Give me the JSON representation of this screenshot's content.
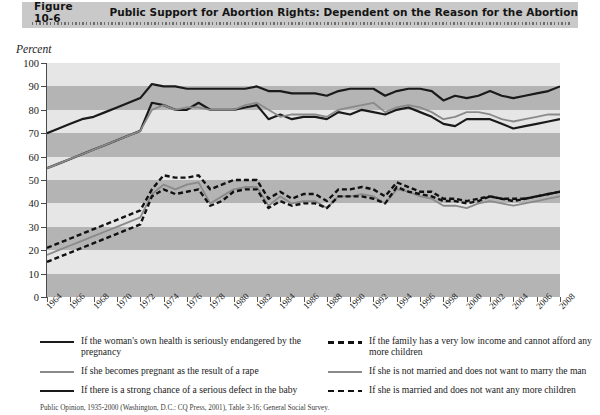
{
  "figure": {
    "number": "Figure 10-6",
    "title": "Public Support for Abortion Rights: Dependent on the Reason for the Abortion"
  },
  "axis": {
    "ylabel": "Percent"
  },
  "source": {
    "text": "Public Opinion, 1935-2000 (Washington, D.C.: CQ Press, 2001), Table 3-16; General Social Survey."
  },
  "legend": {
    "left": [
      {
        "label": "If the woman's own health is seriously endangered by the pregnancy",
        "style": "solid-dark",
        "color": "#1a1a1a"
      },
      {
        "label": "If she becomes pregnant as the result of a rape",
        "style": "solid-gray",
        "color": "#8a8a8a"
      },
      {
        "label": "If there is a strong chance of a serious defect in the baby",
        "style": "solid-dark",
        "color": "#1a1a1a"
      }
    ],
    "right": [
      {
        "label": "If the family has a very low income and cannot afford any more children",
        "style": "dashed",
        "color": "#111111"
      },
      {
        "label": "If she is not married and does not want to marry the man",
        "style": "solid-gray",
        "color": "#8a8a8a"
      },
      {
        "label": "If she is married and does not want any more children",
        "style": "dashed",
        "color": "#111111"
      }
    ]
  },
  "chart_data": {
    "type": "line",
    "title": "Public Support for Abortion Rights: Dependent on the Reason for the Abortion",
    "xlabel": "",
    "ylabel": "Percent",
    "ylim": [
      0,
      100
    ],
    "yticks": [
      0,
      10,
      20,
      30,
      40,
      50,
      60,
      70,
      80,
      90,
      100
    ],
    "xlim": [
      1964,
      2008
    ],
    "xticks": [
      1964,
      1966,
      1968,
      1970,
      1972,
      1974,
      1976,
      1978,
      1980,
      1982,
      1984,
      1986,
      1988,
      1990,
      1992,
      1994,
      1996,
      1998,
      2000,
      2002,
      2004,
      2006,
      2008
    ],
    "grid": "horizontal-bands",
    "legend_position": "below",
    "x": [
      1964,
      1965,
      1966,
      1967,
      1968,
      1969,
      1970,
      1971,
      1972,
      1973,
      1974,
      1975,
      1976,
      1977,
      1978,
      1979,
      1980,
      1981,
      1982,
      1983,
      1984,
      1985,
      1986,
      1987,
      1988,
      1989,
      1990,
      1991,
      1992,
      1993,
      1994,
      1995,
      1996,
      1997,
      1998,
      1999,
      2000,
      2001,
      2002,
      2003,
      2004,
      2005,
      2006,
      2007,
      2008
    ],
    "series": [
      {
        "name": "If the woman's own health is seriously endangered by the pregnancy",
        "style": "solid",
        "color": "#1a1a1a",
        "width": 2.2,
        "values": [
          70,
          72,
          74,
          76,
          77,
          79,
          81,
          83,
          85,
          91,
          90,
          90,
          89,
          89,
          89,
          89,
          89,
          89,
          90,
          88,
          88,
          87,
          87,
          87,
          86,
          88,
          89,
          89,
          89,
          86,
          88,
          89,
          89,
          88,
          84,
          86,
          85,
          86,
          88,
          86,
          85,
          86,
          87,
          88,
          90
        ]
      },
      {
        "name": "If there is a strong chance of a serious defect in the baby",
        "style": "solid",
        "color": "#1a1a1a",
        "width": 2.2,
        "values": [
          55,
          57,
          59,
          61,
          63,
          65,
          67,
          69,
          71,
          83,
          82,
          80,
          80,
          83,
          80,
          80,
          80,
          81,
          82,
          76,
          78,
          76,
          77,
          77,
          76,
          79,
          78,
          80,
          79,
          78,
          80,
          81,
          79,
          77,
          74,
          73,
          76,
          76,
          76,
          74,
          72,
          73,
          74,
          75,
          76
        ]
      },
      {
        "name": "If she becomes pregnant as the result of a rape",
        "style": "solid",
        "color": "#8a8a8a",
        "width": 1.8,
        "values": [
          55,
          57,
          59,
          61,
          63,
          65,
          67,
          69,
          71,
          80,
          82,
          80,
          81,
          81,
          80,
          80,
          80,
          82,
          83,
          80,
          77,
          78,
          78,
          78,
          77,
          80,
          81,
          82,
          83,
          79,
          81,
          82,
          81,
          79,
          76,
          77,
          79,
          79,
          78,
          76,
          75,
          76,
          77,
          78,
          78
        ]
      },
      {
        "name": "If the family has a very low income and cannot afford any more children",
        "style": "dashed",
        "color": "#111111",
        "width": 2.4,
        "values": [
          21,
          23,
          25,
          27,
          29,
          31,
          33,
          35,
          37,
          46,
          52,
          51,
          51,
          52,
          46,
          48,
          50,
          50,
          50,
          42,
          45,
          42,
          44,
          44,
          41,
          46,
          46,
          47,
          46,
          43,
          49,
          47,
          45,
          45,
          42,
          42,
          41,
          42,
          43,
          42,
          42,
          42,
          43,
          44,
          45
        ]
      },
      {
        "name": "If she is not married and does not want to marry the man",
        "style": "solid",
        "color": "#8a8a8a",
        "width": 1.8,
        "values": [
          18,
          20,
          22,
          24,
          26,
          28,
          30,
          32,
          34,
          44,
          48,
          46,
          48,
          49,
          40,
          43,
          46,
          47,
          47,
          39,
          43,
          40,
          41,
          41,
          38,
          43,
          43,
          44,
          43,
          40,
          46,
          45,
          43,
          42,
          39,
          39,
          38,
          40,
          41,
          40,
          39,
          40,
          41,
          42,
          43
        ]
      },
      {
        "name": "If she is married and does not want any more children",
        "style": "dashed",
        "color": "#111111",
        "width": 2.4,
        "values": [
          15,
          17,
          19,
          21,
          23,
          25,
          27,
          29,
          31,
          43,
          46,
          44,
          45,
          46,
          39,
          41,
          45,
          46,
          46,
          38,
          41,
          39,
          40,
          40,
          38,
          43,
          43,
          43,
          42,
          40,
          47,
          45,
          44,
          43,
          41,
          41,
          40,
          41,
          43,
          42,
          41,
          42,
          43,
          44,
          45
        ]
      }
    ]
  }
}
